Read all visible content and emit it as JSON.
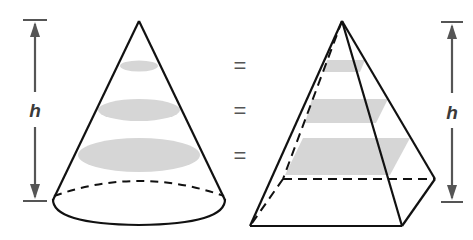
{
  "figure": {
    "left_solid": "cone",
    "right_solid": "pyramid",
    "left_height_label": "h",
    "right_height_label": "h",
    "equals_signs": [
      "=",
      "=",
      "="
    ],
    "colors": {
      "outline": "#111111",
      "cross_section_fill": "#d6d6d6",
      "dimension_arrow": "#555555"
    }
  }
}
